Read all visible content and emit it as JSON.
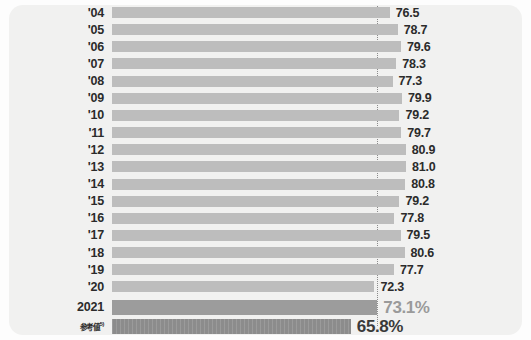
{
  "chart_data": {
    "type": "bar",
    "orientation": "horizontal",
    "title": "",
    "subtitle": "",
    "xlabel": "",
    "ylabel": "",
    "xlim": [
      0,
      100
    ],
    "grid": false,
    "legend": null,
    "reference_line": {
      "label": "",
      "value": 73.1,
      "style": "dotted-vertical"
    },
    "categories": [
      "'04",
      "'05",
      "'06",
      "'07",
      "'08",
      "'09",
      "'10",
      "'11",
      "'12",
      "'13",
      "'14",
      "'15",
      "'16",
      "'17",
      "'18",
      "'19",
      "'20",
      "2021",
      "参考値"
    ],
    "values": [
      76.5,
      78.7,
      79.6,
      78.3,
      77.3,
      79.9,
      79.2,
      79.7,
      80.9,
      81.0,
      80.8,
      79.2,
      77.8,
      79.5,
      80.6,
      77.7,
      72.3,
      73.1,
      65.8
    ],
    "value_labels": [
      "76.5",
      "78.7",
      "79.6",
      "78.3",
      "77.3",
      "79.9",
      "79.2",
      "79.7",
      "80.9",
      "81.0",
      "80.8",
      "79.2",
      "77.8",
      "79.5",
      "80.6",
      "77.7",
      "72.3",
      "73.1%",
      "65.8%"
    ],
    "colors": {
      "historical_bar": "#bdbdbd",
      "current_bar": "#9c9c9c",
      "reference_bar": "#8c8c8c",
      "card_background": "#f1f1f0",
      "label_text": "#2b2b2b",
      "current_value_text": "#9a9a9a",
      "reference_value_text": "#3a3a3a",
      "reference_line": "#8b8b8b"
    }
  },
  "rows": [
    {
      "label": "'04",
      "value_label": "76.5",
      "value": 76.5,
      "kind": "hist"
    },
    {
      "label": "'05",
      "value_label": "78.7",
      "value": 78.7,
      "kind": "hist"
    },
    {
      "label": "'06",
      "value_label": "79.6",
      "value": 79.6,
      "kind": "hist"
    },
    {
      "label": "'07",
      "value_label": "78.3",
      "value": 78.3,
      "kind": "hist"
    },
    {
      "label": "'08",
      "value_label": "77.3",
      "value": 77.3,
      "kind": "hist"
    },
    {
      "label": "'09",
      "value_label": "79.9",
      "value": 79.9,
      "kind": "hist"
    },
    {
      "label": "'10",
      "value_label": "79.2",
      "value": 79.2,
      "kind": "hist"
    },
    {
      "label": "'11",
      "value_label": "79.7",
      "value": 79.7,
      "kind": "hist"
    },
    {
      "label": "'12",
      "value_label": "80.9",
      "value": 80.9,
      "kind": "hist"
    },
    {
      "label": "'13",
      "value_label": "81.0",
      "value": 81.0,
      "kind": "hist"
    },
    {
      "label": "'14",
      "value_label": "80.8",
      "value": 80.8,
      "kind": "hist"
    },
    {
      "label": "'15",
      "value_label": "79.2",
      "value": 79.2,
      "kind": "hist"
    },
    {
      "label": "'16",
      "value_label": "77.8",
      "value": 77.8,
      "kind": "hist"
    },
    {
      "label": "'17",
      "value_label": "79.5",
      "value": 79.5,
      "kind": "hist"
    },
    {
      "label": "'18",
      "value_label": "80.6",
      "value": 80.6,
      "kind": "hist"
    },
    {
      "label": "'19",
      "value_label": "77.7",
      "value": 77.7,
      "kind": "hist"
    },
    {
      "label": "'20",
      "value_label": "72.3",
      "value": 72.3,
      "kind": "hist"
    },
    {
      "label": "2021",
      "value_label": "73.1%",
      "value": 73.1,
      "kind": "cur"
    },
    {
      "label": "参考値",
      "label_sup": "5)",
      "value_label": "65.8%",
      "value": 65.8,
      "kind": "ref"
    }
  ]
}
